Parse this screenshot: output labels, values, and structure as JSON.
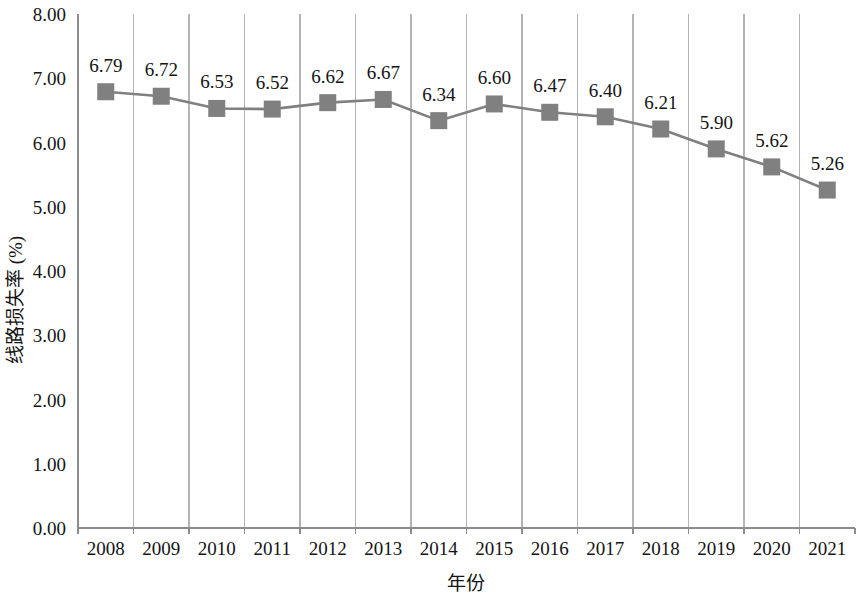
{
  "chart_data": {
    "type": "line",
    "title": "",
    "xlabel": "年份",
    "ylabel": "线路损失率 (%)",
    "categories": [
      "2008",
      "2009",
      "2010",
      "2011",
      "2012",
      "2013",
      "2014",
      "2015",
      "2016",
      "2017",
      "2018",
      "2019",
      "2020",
      "2021"
    ],
    "values": [
      6.79,
      6.72,
      6.53,
      6.52,
      6.62,
      6.67,
      6.34,
      6.6,
      6.47,
      6.4,
      6.21,
      5.9,
      5.62,
      5.26
    ],
    "data_labels": [
      "6.79",
      "6.72",
      "6.53",
      "6.52",
      "6.62",
      "6.67",
      "6.34",
      "6.60",
      "6.47",
      "6.40",
      "6.21",
      "5.90",
      "5.62",
      "5.26"
    ],
    "ylim": [
      0.0,
      8.0
    ],
    "y_ticks": [
      0.0,
      1.0,
      2.0,
      3.0,
      4.0,
      5.0,
      6.0,
      7.0,
      8.0
    ],
    "y_tick_labels": [
      "0.00",
      "1.00",
      "2.00",
      "3.00",
      "4.00",
      "5.00",
      "6.00",
      "7.00",
      "8.00"
    ],
    "grid": "vertical-only",
    "legend": "none",
    "marker": "square",
    "series_color": "#808080",
    "line_color": "#808080",
    "gridline_color": "#b4b4b4",
    "axis_color": "#8c8c8c",
    "text_color": "#141414"
  }
}
